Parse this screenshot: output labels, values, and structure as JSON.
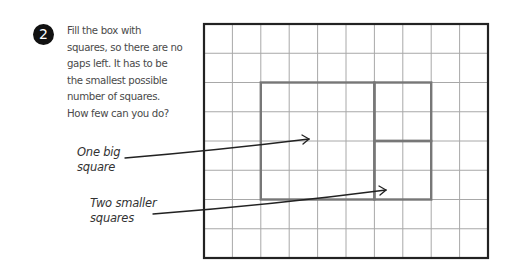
{
  "exercise": {
    "number": "2",
    "instructions_lines": [
      "Fill the box with",
      "squares, so there are no",
      "gaps left. It has to be",
      "the smallest possible",
      "number of squares.",
      "How few can you do?"
    ]
  },
  "annotations": {
    "big_square_label": [
      "One big",
      "square"
    ],
    "small_squares_label": [
      "Two smaller",
      "squares"
    ]
  },
  "grid": {
    "columns": 10,
    "rows": 8,
    "line_color": "#a8a8a8",
    "border_color": "#222222",
    "highlight_color": "#777777"
  },
  "squares": [
    {
      "name": "big-square",
      "col": 2,
      "row": 2,
      "size": 4
    },
    {
      "name": "small-square-top",
      "col": 6,
      "row": 2,
      "size": 2
    },
    {
      "name": "small-square-bottom",
      "col": 6,
      "row": 4,
      "size": 2
    }
  ]
}
